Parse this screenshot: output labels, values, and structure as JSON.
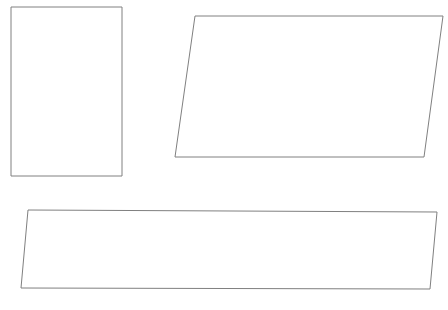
{
  "canvas": {
    "width": 448,
    "height": 310,
    "background_color": "#ffffff"
  },
  "style": {
    "stroke_color": "#808080",
    "stroke_width": 1,
    "fill": "none"
  },
  "figure": {
    "title": "",
    "shape_count": 3
  },
  "shapes": [
    {
      "name": "rectangle",
      "kind": "rectangle",
      "points": "11,7 122,7 122,176 11,176",
      "vertices": [
        [
          11,
          7
        ],
        [
          122,
          7
        ],
        [
          122,
          176
        ],
        [
          11,
          176
        ]
      ],
      "width": 111,
      "height": 169
    },
    {
      "name": "right-parallelogram",
      "kind": "parallelogram",
      "points": "195,16 443,16 424,157 175,157",
      "vertices": [
        [
          195,
          16
        ],
        [
          443,
          16
        ],
        [
          424,
          157
        ],
        [
          175,
          157
        ]
      ],
      "width": 248,
      "height": 141,
      "slant": -20
    },
    {
      "name": "bottom-parallelogram",
      "kind": "parallelogram",
      "points": "28,210 437,212 430,289 21,288",
      "vertices": [
        [
          28,
          210
        ],
        [
          437,
          212
        ],
        [
          430,
          289
        ],
        [
          21,
          288
        ]
      ],
      "width": 409,
      "height": 78,
      "slant": -7
    }
  ]
}
